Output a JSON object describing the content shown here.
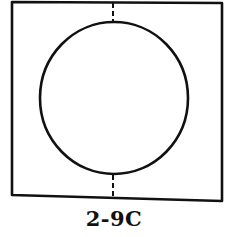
{
  "figure": {
    "label": "2-9C",
    "stroke_color": "#111111",
    "background": "#ffffff",
    "frame": {
      "shape": "rectangle",
      "corners": [
        [
          12,
          2
        ],
        [
          222,
          3
        ],
        [
          222,
          201
        ],
        [
          12,
          195
        ]
      ]
    },
    "circle": {
      "cx": 114,
      "cy": 98,
      "rx": 74,
      "ry": 76
    },
    "dashed_axis": {
      "x": 113,
      "top_segment": [
        2,
        22
      ],
      "bottom_segment": [
        174,
        199
      ]
    }
  }
}
